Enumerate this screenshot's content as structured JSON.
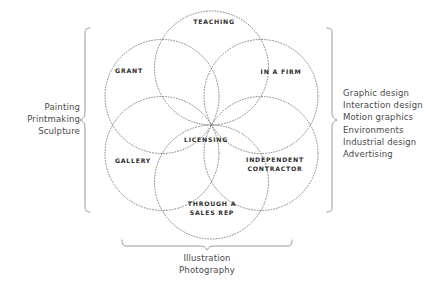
{
  "diagram": {
    "type": "venn-rosette",
    "circle_count": 6,
    "stroke_style": "dotted",
    "circle_color": "#6e6e6e",
    "brace_color": "#8d8d8d",
    "label_color": "#2f2f2f",
    "text_color": "#4a4a4a",
    "background": "#ffffff"
  },
  "venn_labels": [
    {
      "id": "teaching",
      "text": "TEACHING",
      "x": 214,
      "y": 22
    },
    {
      "id": "grant",
      "text": "GRANT",
      "x": 129,
      "y": 71
    },
    {
      "id": "in-a-firm",
      "text": "IN A FIRM",
      "x": 281,
      "y": 72
    },
    {
      "id": "licensing",
      "text": "LICENSING",
      "x": 206,
      "y": 140
    },
    {
      "id": "gallery",
      "text": "GALLERY",
      "x": 133,
      "y": 161
    },
    {
      "id": "independent-contractor",
      "text": "INDEPENDENT\nCONTRACTOR",
      "x": 275,
      "y": 165
    },
    {
      "id": "through-a-sales-rep",
      "text": "THROUGH A\nSALES REP",
      "x": 212,
      "y": 209
    }
  ],
  "left_block": {
    "id": "fine-art-disciplines",
    "brace_side": "left",
    "text": "Painting\nPrintmaking\nSculpture",
    "items": [
      "Painting",
      "Printmaking",
      "Sculpture"
    ]
  },
  "right_block": {
    "id": "design-disciplines",
    "brace_side": "right",
    "text": "Graphic design\nInteraction design\nMotion graphics\nEnvironments\nIndustrial design\nAdvertising",
    "items": [
      "Graphic design",
      "Interaction design",
      "Motion graphics",
      "Environments",
      "Industrial design",
      "Advertising"
    ]
  },
  "bottom_block": {
    "id": "image-making-disciplines",
    "brace_side": "bottom",
    "text": "Illustration\nPhotography",
    "items": [
      "Illustration",
      "Photography"
    ]
  }
}
